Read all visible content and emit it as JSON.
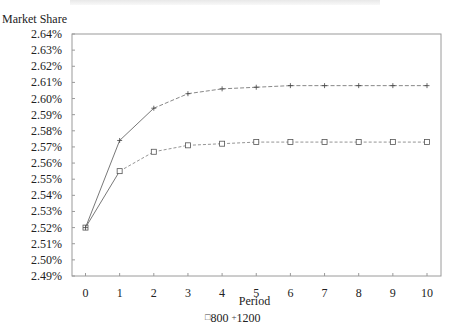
{
  "chart_data": {
    "type": "line",
    "title": "",
    "xlabel": "Period",
    "ylabel": "Market Share",
    "x": [
      0,
      1,
      2,
      3,
      4,
      5,
      6,
      7,
      8,
      9,
      10
    ],
    "series": [
      {
        "name": "800",
        "marker": "square",
        "values": [
          2.52,
          2.555,
          2.567,
          2.571,
          2.572,
          2.573,
          2.573,
          2.573,
          2.573,
          2.573,
          2.573
        ]
      },
      {
        "name": "1200",
        "marker": "plus",
        "values": [
          2.52,
          2.574,
          2.594,
          2.603,
          2.606,
          2.607,
          2.608,
          2.608,
          2.608,
          2.608,
          2.608
        ]
      }
    ],
    "ylim": [
      2.49,
      2.64
    ],
    "yticks": [
      "2.49%",
      "2.50%",
      "2.51%",
      "2.52%",
      "2.53%",
      "2.54%",
      "2.55%",
      "2.56%",
      "2.57%",
      "2.58%",
      "2.59%",
      "2.60%",
      "2.61%",
      "2.62%",
      "2.63%",
      "2.64%"
    ],
    "xticks": [
      "0",
      "1",
      "2",
      "3",
      "4",
      "5",
      "6",
      "7",
      "8",
      "9",
      "10"
    ],
    "grid": false,
    "legend_position": "bottom"
  },
  "labels": {
    "y_axis": "Market Share",
    "x_axis": "Period",
    "legend_800": "800",
    "legend_1200": "1200",
    "legend_square": "□",
    "legend_plus": "+"
  }
}
